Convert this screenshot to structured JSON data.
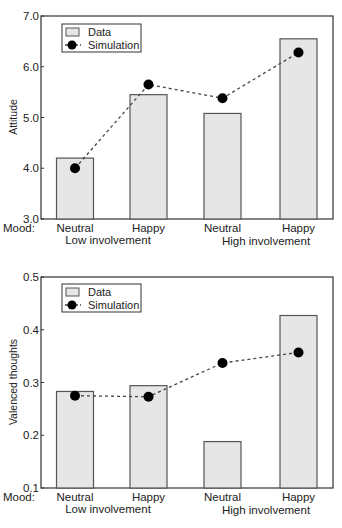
{
  "chart_data": [
    {
      "type": "bar",
      "title": "",
      "xlabel": "",
      "ylabel": "Attitude",
      "ylim": [
        3.0,
        7.0
      ],
      "yticks": [
        "3.0",
        "4.0",
        "5.0",
        "6.0",
        "7.0"
      ],
      "x_prefix_label": "Mood:",
      "categories": [
        "Neutral",
        "Happy",
        "Neutral",
        "Happy"
      ],
      "group_labels": [
        "Low involvement",
        "High involvement"
      ],
      "legend": {
        "position": "upper-left",
        "entries": [
          "Data",
          "Simulation"
        ]
      },
      "grid": false,
      "series": [
        {
          "name": "Data",
          "type": "bar",
          "values": [
            4.2,
            5.45,
            5.08,
            6.55
          ]
        },
        {
          "name": "Simulation",
          "type": "line-dashed-markers",
          "values": [
            4.0,
            5.65,
            5.38,
            6.28
          ]
        }
      ]
    },
    {
      "type": "bar",
      "title": "",
      "xlabel": "",
      "ylabel": "Valenced thoughts",
      "ylim": [
        0.1,
        0.5
      ],
      "yticks": [
        "0.1",
        "0.2",
        "0.3",
        "0.4",
        "0.5"
      ],
      "x_prefix_label": "Mood:",
      "categories": [
        "Neutral",
        "Happy",
        "Neutral",
        "Happy"
      ],
      "group_labels": [
        "Low involvement",
        "High involvement"
      ],
      "legend": {
        "position": "upper-left",
        "entries": [
          "Data",
          "Simulation"
        ]
      },
      "grid": false,
      "series": [
        {
          "name": "Data",
          "type": "bar",
          "values": [
            0.283,
            0.294,
            0.188,
            0.427
          ]
        },
        {
          "name": "Simulation",
          "type": "line-dashed-markers",
          "values": [
            0.275,
            0.273,
            0.337,
            0.357
          ]
        }
      ]
    }
  ],
  "colors": {
    "bar_fill": "#e6e6e6",
    "bar_stroke": "#555555",
    "marker": "#000000",
    "line": "#444444",
    "axis": "#333333"
  }
}
